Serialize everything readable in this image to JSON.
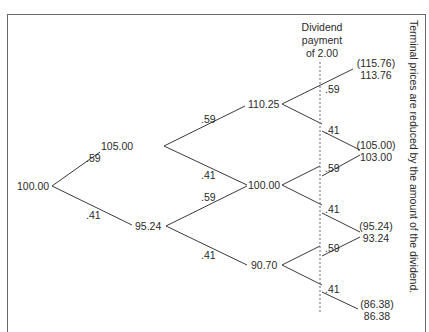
{
  "diagram": {
    "dividend_note": {
      "line1": "Dividend",
      "line2": "payment",
      "line3": "of 2.00"
    },
    "side_note": "Terminal prices are reduced by the amount of the dividend.",
    "probabilities": {
      "up": ".59",
      "down": ".41"
    },
    "nodes": {
      "root": "100.00",
      "u": "105.00",
      "d": "95.24",
      "uu": "110.25",
      "ud": "100.00",
      "dd": "90.70"
    },
    "terminals": [
      {
        "before": "(115.76)",
        "after": "113.76"
      },
      {
        "before": "(105.00)",
        "after": "103.00"
      },
      {
        "before": "(95.24)",
        "after": "93.24"
      },
      {
        "before": "(86.38)",
        "after": "86.38"
      }
    ],
    "edge_labels": [
      {
        "id": "root-u",
        "text": ".59"
      },
      {
        "id": "root-d",
        "text": ".41"
      },
      {
        "id": "u-uu",
        "text": ".59"
      },
      {
        "id": "u-ud",
        "text": ".41"
      },
      {
        "id": "d-ud",
        "text": ".59"
      },
      {
        "id": "d-dd",
        "text": ".41"
      },
      {
        "id": "uu-t1",
        "text": ".59"
      },
      {
        "id": "uu-t2",
        "text": ".41"
      },
      {
        "id": "ud-t2",
        "text": ".59"
      },
      {
        "id": "ud-t3",
        "text": ".41"
      },
      {
        "id": "dd-t3",
        "text": ".59"
      },
      {
        "id": "dd-t4",
        "text": ".41"
      }
    ]
  }
}
